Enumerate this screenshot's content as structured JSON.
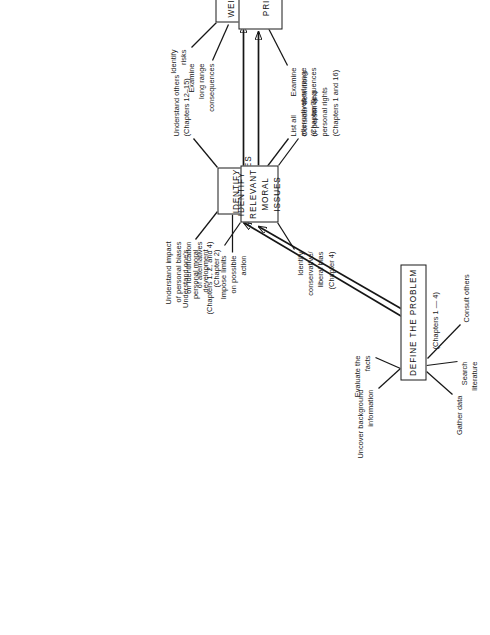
{
  "diagram": {
    "orientation": "rotated-90-ccw",
    "background_color": "#ffffff",
    "line_color": "#161616",
    "nodes": [
      {
        "id": "define",
        "label": "DEFINE THE PROBLEM"
      },
      {
        "id": "identify_alternatives",
        "label": "IDENTIFY\nALTERNATIVES"
      },
      {
        "id": "weight_quantify",
        "label": "WEIGHT OR QUANTIFY\nALTERNATIVES"
      },
      {
        "id": "identify_moral",
        "label": "IDENTIFY RELEVANT\nMORAL ISSUES"
      },
      {
        "id": "weight_prioritize",
        "label": "WEIGHT OR\nPRIORITIZE VALUES"
      }
    ],
    "annotations": [
      {
        "id": "chapters_1_4",
        "text": "(Chapters 1 — 4)",
        "attached_to": "define"
      },
      {
        "id": "uncover",
        "text": "Uncover background\ninformation",
        "attached_to": "define"
      },
      {
        "id": "evaluate",
        "text": "Evaluate the\nfacts",
        "attached_to": "define"
      },
      {
        "id": "gather",
        "text": "Gather data",
        "attached_to": "define"
      },
      {
        "id": "search",
        "text": "Search\nliterature",
        "attached_to": "define"
      },
      {
        "id": "consult",
        "text": "Consult others",
        "attached_to": "define"
      },
      {
        "id": "impose",
        "text": "Impose limits\non possible\naction",
        "attached_to": "identify_alternatives"
      },
      {
        "id": "bias_impact",
        "text": "Understand impact\nof personal biases\non identification\nof alternatives\n(Chapters 1, 2, and 4)",
        "attached_to": "identify_alternatives"
      },
      {
        "id": "understand_others",
        "text": "Understand others\n(Chapters 12–15)",
        "attached_to": "identify_alternatives"
      },
      {
        "id": "list_all",
        "text": "List all\nalternatives\n(Chapter 7)",
        "attached_to": "identify_alternatives"
      },
      {
        "id": "identify_risks",
        "text": "Identify\nrisks",
        "attached_to": "weight_quantify"
      },
      {
        "id": "long_range",
        "text": "Examine\nlong range\nconsequences",
        "attached_to": "weight_quantify"
      },
      {
        "id": "short_range",
        "text": "Examine\nshort range\nconsequences",
        "attached_to": "weight_quantify"
      },
      {
        "id": "moral_dev",
        "text": "Understand one's\npersonal moral\ndevelopment\n(Chapter 2)",
        "attached_to": "identify_moral"
      },
      {
        "id": "conservative_bias",
        "text": "Identify\nconservative/\nliberal bias\n(Chapter 4)",
        "attached_to": "identify_moral"
      },
      {
        "id": "definitions",
        "text": "Consider definitions\nof person and\npersonal rights\n(Chapters 1 and 16)",
        "attached_to": "identify_moral"
      }
    ]
  }
}
